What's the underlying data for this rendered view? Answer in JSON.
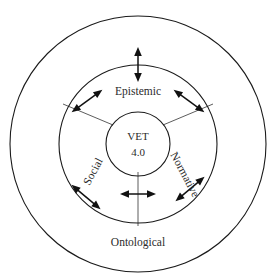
{
  "diagram": {
    "background_color": "#ffffff",
    "stroke_color": "#1a1a1a",
    "text_color": "#2b2b2b",
    "center": {
      "cx": 138,
      "cy": 144
    },
    "rings": [
      {
        "name": "outer-ring",
        "label_key": "ontological",
        "radius": 128,
        "stroke_width": 1.1
      },
      {
        "name": "middle-ring",
        "label_key": "epistemic",
        "radius": 79,
        "stroke_width": 1.1
      },
      {
        "name": "inner-ring",
        "label_key": "vet",
        "radius": 32,
        "stroke_width": 1.1
      }
    ],
    "labels": {
      "center_line1": "VET",
      "center_line2": "4.0",
      "epistemic": "Epistemic",
      "social": "Social",
      "normative": "Normative",
      "ontological": "Ontological"
    },
    "label_positions": {
      "center_line1": {
        "x": 138,
        "y": 137,
        "rotation": 0
      },
      "center_line2": {
        "x": 138,
        "y": 153,
        "rotation": 0
      },
      "epistemic": {
        "x": 138,
        "y": 92,
        "rotation": 0
      },
      "social": {
        "x": 94,
        "y": 172,
        "rotation": -62
      },
      "normative": {
        "x": 184,
        "y": 175,
        "rotation": 62
      },
      "ontological": {
        "x": 138,
        "y": 243,
        "rotation": 0
      }
    },
    "arrows": {
      "style": "double-headed",
      "count": 6,
      "items": [
        {
          "name": "arrow-top",
          "angle_deg": 90,
          "description": "vertical double arrow crossing middle ring at top"
        },
        {
          "name": "arrow-upper-left",
          "angle_deg": 143,
          "description": "diagonal double arrow crossing middle ring upper-left"
        },
        {
          "name": "arrow-upper-right",
          "angle_deg": 37,
          "description": "diagonal double arrow crossing middle ring upper-right"
        },
        {
          "name": "arrow-lower-left",
          "angle_deg": 217,
          "description": "diagonal double arrow crossing middle ring lower-left"
        },
        {
          "name": "arrow-lower-right",
          "angle_deg": 323,
          "description": "diagonal double arrow crossing middle ring lower-right"
        },
        {
          "name": "arrow-bottom-center",
          "angle_deg": 270,
          "description": "horizontal double arrow below inner ring"
        }
      ]
    }
  }
}
